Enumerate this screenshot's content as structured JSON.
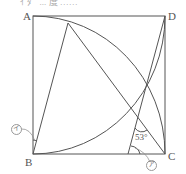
{
  "header": {
    "cut_text": "ｲ ﾀﾞ ... 度 ……"
  },
  "points": {
    "A": {
      "label": "A",
      "x": 33,
      "y": 16
    },
    "B": {
      "label": "B",
      "x": 33,
      "y": 154
    },
    "C": {
      "label": "C",
      "x": 165,
      "y": 154
    },
    "D": {
      "label": "D",
      "x": 165,
      "y": 16
    }
  },
  "angles": {
    "given": "53°",
    "unknown_a": "ア",
    "unknown_i": "イ"
  },
  "colors": {
    "line": "#555555",
    "text": "#555555"
  }
}
